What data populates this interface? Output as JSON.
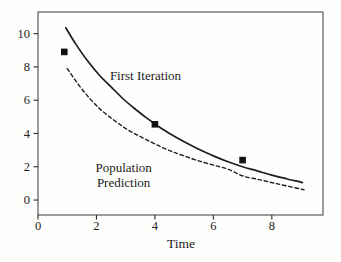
{
  "figure": {
    "background": "#fefefd",
    "ink_color": "#1d1d1d",
    "frame_color": "#5a5a5a",
    "tick_color": "#2c2c2c"
  },
  "chart_data": {
    "type": "line",
    "title": "",
    "xlabel": "Time",
    "ylabel": "",
    "xlim": [
      0,
      9.75
    ],
    "ylim": [
      -0.9,
      11.3
    ],
    "x_ticks": [
      0,
      2,
      4,
      6,
      8
    ],
    "y_ticks": [
      0,
      2,
      4,
      6,
      8,
      10
    ],
    "grid": false,
    "legend": "inline text annotations, no legend box",
    "series": [
      {
        "name": "First Iteration",
        "style": "solid",
        "stroke_width": 1.7,
        "x": [
          0.95,
          1.3,
          1.7,
          2.1,
          2.5,
          2.9,
          3.3,
          3.7,
          4.1,
          4.5,
          5.0,
          5.5,
          6.0,
          6.5,
          7.0,
          7.5,
          8.0,
          8.5,
          9.05
        ],
        "y": [
          10.35,
          9.35,
          8.35,
          7.5,
          6.8,
          6.1,
          5.5,
          4.95,
          4.45,
          4.0,
          3.5,
          3.05,
          2.65,
          2.3,
          2.0,
          1.75,
          1.5,
          1.28,
          1.05
        ]
      },
      {
        "name": "Population Prediction",
        "style": "dashed",
        "stroke_width": 1.4,
        "dash_pattern": "3.5 2.8",
        "x": [
          1.0,
          1.4,
          1.8,
          2.2,
          2.6,
          3.0,
          3.4,
          3.8,
          4.2,
          4.6,
          5.0,
          5.5,
          6.0,
          6.5,
          7.0,
          7.5,
          8.0,
          8.5,
          9.1
        ],
        "y": [
          7.9,
          6.9,
          6.05,
          5.35,
          4.8,
          4.3,
          3.9,
          3.55,
          3.2,
          2.9,
          2.65,
          2.35,
          2.1,
          1.85,
          1.45,
          1.25,
          1.05,
          0.85,
          0.62
        ]
      }
    ],
    "scatter_points": {
      "marker": "filled-square",
      "marker_size_px": 6.6,
      "points": [
        [
          0.9,
          8.9
        ],
        [
          4.0,
          4.55
        ],
        [
          7.0,
          2.4
        ]
      ]
    },
    "annotations": [
      {
        "text": "First Iteration",
        "x": 2.46,
        "y": 7.2,
        "anchor": "start"
      },
      {
        "text": "Population\nPrediction",
        "x": 2.93,
        "y": 1.68,
        "anchor": "middle"
      }
    ]
  }
}
